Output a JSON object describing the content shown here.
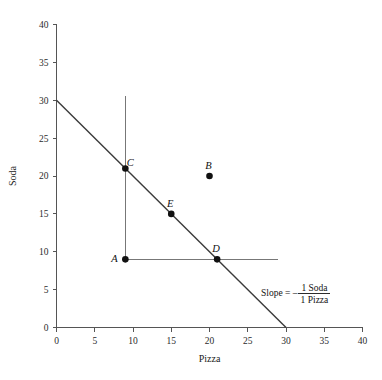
{
  "chart_data": {
    "type": "scatter",
    "title": "",
    "xlabel": "Pizza",
    "ylabel": "Soda",
    "xlim": [
      0,
      40
    ],
    "ylim": [
      0,
      40
    ],
    "xticks": [
      0,
      5,
      10,
      15,
      20,
      25,
      30,
      35,
      40
    ],
    "yticks": [
      0,
      5,
      10,
      15,
      20,
      25,
      30,
      35,
      40
    ],
    "xtick_labels": [
      "0",
      "5",
      "10",
      "15",
      "20",
      "25",
      "30",
      "35",
      "40"
    ],
    "ytick_labels": [
      "0",
      "5",
      "10",
      "15",
      "20",
      "25",
      "30",
      "35",
      "40"
    ],
    "grid": false,
    "legend": "none",
    "points": [
      {
        "label": "A",
        "x": 9,
        "y": 9,
        "label_dx": -11,
        "label_dy": 3
      },
      {
        "label": "B",
        "x": 20,
        "y": 20,
        "label_dx": -1,
        "label_dy": -7
      },
      {
        "label": "C",
        "x": 9,
        "y": 21,
        "label_dx": 5,
        "label_dy": -2
      },
      {
        "label": "D",
        "x": 21,
        "y": 9,
        "label_dx": -1,
        "label_dy": -7
      },
      {
        "label": "E",
        "x": 15,
        "y": 15,
        "label_dx": -1,
        "label_dy": -7
      }
    ],
    "lines": [
      {
        "name": "budget-constraint-line",
        "x0": 0,
        "y0": 30,
        "x1": 30,
        "y1": 0,
        "style": "solid"
      },
      {
        "name": "vertical-constraint-line",
        "x0": 9,
        "y0": 30.5,
        "x1": 9,
        "y1": 9,
        "style": "solid"
      },
      {
        "name": "horizontal-constraint-line",
        "x0": 9,
        "y0": 9,
        "x1": 29,
        "y1": 9,
        "style": "solid"
      }
    ],
    "annotations": [
      {
        "name": "slope-annotation",
        "prefix": "Slope = –",
        "numerator": "1 Soda",
        "denominator": "1 Pizza",
        "x": 31.5,
        "y": 4.2
      }
    ],
    "colors": {
      "background": "#ffffff",
      "axis": "#555555",
      "budget_line": "#3a3a3a",
      "guide_line": "#777777",
      "point": "#111111",
      "text": "#1a1a1a"
    }
  }
}
